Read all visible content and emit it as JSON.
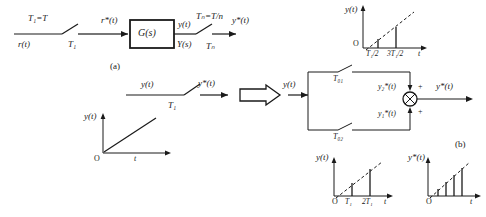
{
  "figure": {
    "caption_a": "(a)",
    "caption_b": "(b)"
  },
  "part_a": {
    "input_signal": "r(t)",
    "sampler_in_period_eq": "T₁=T",
    "sampler_in_period": "T₁",
    "sampled_input": "r*(t)",
    "block_label": "G(s)",
    "block_output_time": "y(t)",
    "block_output_freq": "Y(s)",
    "sampler_out_period_eq": "Tₙ=T/n",
    "sampler_out_period": "Tₙ",
    "output_signal": "y*(t)"
  },
  "chart_top": {
    "type": "impulse",
    "ylabel": "y(t)",
    "xlabel": "t",
    "origin_label": "O",
    "ticks": [
      "T₁/2",
      "3T₁/2"
    ],
    "values": [
      0.5,
      1.5
    ],
    "envelope": "ramp",
    "dashed_envelope": true
  },
  "middle": {
    "input_signal": "y(t)",
    "sampler_period": "T₁",
    "output_signal": "y*(t)",
    "arrow_glyph": "⇒"
  },
  "chart_ramp": {
    "type": "line",
    "ylabel": "y(t)",
    "xlabel": "t",
    "origin_label": "O",
    "description": "continuous ramp"
  },
  "part_b": {
    "input_signal": "y(t)",
    "upper_sampler_period": "T₀₁",
    "lower_sampler_period": "T₀₂",
    "upper_branch_signal": "y₂*(t)",
    "lower_branch_signal": "y₁*(t)",
    "sum_sign_upper": "+",
    "sum_sign_lower": "+",
    "output_signal": "y*(t)",
    "summing_junction": "summing-junction"
  },
  "chart_bottom_left": {
    "type": "impulse",
    "ylabel": "y(t)",
    "xlabel": "t",
    "origin_label": "O",
    "ticks": [
      "T₁",
      "2T₁"
    ],
    "values": [
      1,
      2
    ],
    "envelope": "ramp",
    "dashed_envelope": true
  },
  "chart_bottom_right": {
    "type": "impulse",
    "ylabel": "y*(t)",
    "xlabel": "t",
    "origin_label": "O",
    "ticks": [],
    "values": [
      1,
      2,
      3,
      4
    ],
    "envelope": "ramp",
    "dashed_envelope": true
  },
  "colors": {
    "ink": "#1a1a1a",
    "paper": "#ffffff"
  }
}
